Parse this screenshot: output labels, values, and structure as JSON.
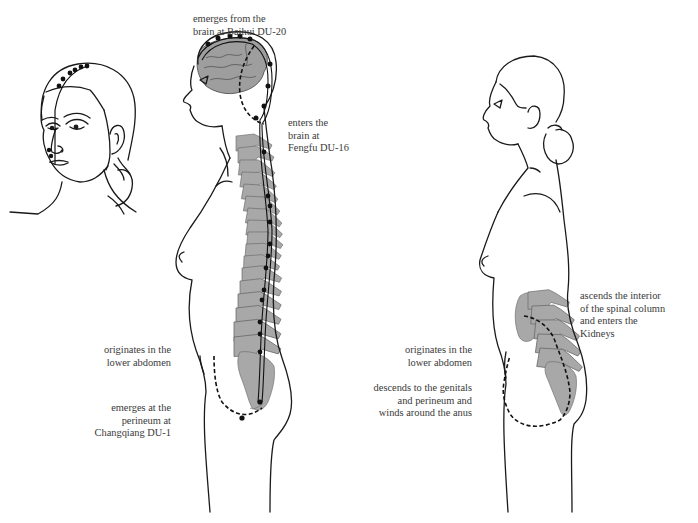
{
  "figure": {
    "colors": {
      "outline": "#1a1a1a",
      "bone_fill": "#a8a8a8",
      "brain_fill": "#9e9e9e",
      "channel": "#111111",
      "text": "#3a3a3a",
      "background": "#ffffff"
    },
    "panels": [
      {
        "name": "frontal-head",
        "description": "Three-quarter head view showing channel over vertex and down the midline of the face"
      },
      {
        "name": "main-channel-lateral",
        "description": "Lateral view showing main Du channel along the spine and over the head"
      },
      {
        "name": "internal-branch-lateral",
        "description": "Lateral view showing internal branch ascending to the Kidneys"
      }
    ]
  },
  "labels": {
    "baihui": [
      "emerges from the",
      "brain at Baihui DU-20"
    ],
    "fengfu": [
      "enters the",
      "brain at",
      "Fengfu DU-16"
    ],
    "left_origin": [
      "originates in the",
      "lower abdomen"
    ],
    "changqiang": [
      "emerges at the",
      "perineum at",
      "Changqiang DU-1"
    ],
    "right_origin": [
      "originates in the",
      "lower abdomen"
    ],
    "descends": [
      "descends to the genitals",
      "and perineum and",
      "winds around the anus"
    ],
    "ascends": [
      "ascends the interior",
      "of the spinal column",
      "and enters the",
      "Kidneys"
    ]
  }
}
